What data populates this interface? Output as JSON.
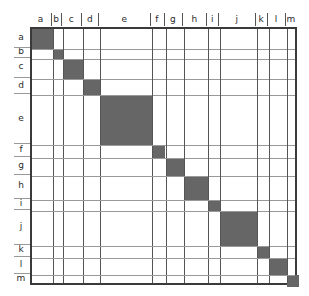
{
  "figure": {
    "title": ""
  },
  "axes": {
    "column_labels": [
      "a",
      "b",
      "c",
      "d",
      "e",
      "f",
      "g",
      "h",
      "i",
      "j",
      "k",
      "l",
      "m"
    ],
    "row_labels": [
      "a",
      "b",
      "c",
      "d",
      "e",
      "f",
      "g",
      "h",
      "i",
      "j",
      "k",
      "l",
      "m"
    ]
  },
  "colors": {
    "block_fill": "#666666",
    "frame": "#3a3a3a",
    "column_divider": "#555555",
    "row_divider": "#999999",
    "background": "#ffffff",
    "label": "#2b2b2b"
  },
  "chart_data": {
    "type": "heatmap",
    "title": "",
    "subtitle": "",
    "xlabel": "",
    "ylabel": "",
    "grid": true,
    "legend": "none",
    "symmetric": true,
    "note": "Block-diagonal adjacency matrix: each labelled group forms one filled square on the diagonal; all off-diagonal cells are empty.",
    "categories": [
      "a",
      "b",
      "c",
      "d",
      "e",
      "f",
      "g",
      "h",
      "i",
      "j",
      "k",
      "l",
      "m"
    ],
    "blocks": [
      {
        "label": "a",
        "start_frac": 0.0,
        "end_frac": 0.079,
        "size_frac": 0.079,
        "filled": true
      },
      {
        "label": "b",
        "start_frac": 0.079,
        "end_frac": 0.117,
        "size_frac": 0.038,
        "filled": true
      },
      {
        "label": "c",
        "start_frac": 0.117,
        "end_frac": 0.192,
        "size_frac": 0.075,
        "filled": true
      },
      {
        "label": "d",
        "start_frac": 0.192,
        "end_frac": 0.256,
        "size_frac": 0.064,
        "filled": true
      },
      {
        "label": "e",
        "start_frac": 0.256,
        "end_frac": 0.451,
        "size_frac": 0.195,
        "filled": true
      },
      {
        "label": "f",
        "start_frac": 0.451,
        "end_frac": 0.5,
        "size_frac": 0.049,
        "filled": true
      },
      {
        "label": "g",
        "start_frac": 0.5,
        "end_frac": 0.571,
        "size_frac": 0.071,
        "filled": true
      },
      {
        "label": "h",
        "start_frac": 0.571,
        "end_frac": 0.661,
        "size_frac": 0.09,
        "filled": true
      },
      {
        "label": "i",
        "start_frac": 0.661,
        "end_frac": 0.705,
        "size_frac": 0.044,
        "filled": true
      },
      {
        "label": "j",
        "start_frac": 0.705,
        "end_frac": 0.843,
        "size_frac": 0.138,
        "filled": true
      },
      {
        "label": "k",
        "start_frac": 0.843,
        "end_frac": 0.888,
        "size_frac": 0.045,
        "filled": true
      },
      {
        "label": "l",
        "start_frac": 0.888,
        "end_frac": 0.955,
        "size_frac": 0.067,
        "filled": true
      },
      {
        "label": "m",
        "start_frac": 0.955,
        "end_frac": 1.0,
        "size_frac": 0.045,
        "filled": true
      }
    ],
    "x": [
      "a",
      "b",
      "c",
      "d",
      "e",
      "f",
      "g",
      "h",
      "i",
      "j",
      "k",
      "l",
      "m"
    ],
    "y": [
      "a",
      "b",
      "c",
      "d",
      "e",
      "f",
      "g",
      "h",
      "i",
      "j",
      "k",
      "l",
      "m"
    ],
    "values": [
      [
        1,
        0,
        0,
        0,
        0,
        0,
        0,
        0,
        0,
        0,
        0,
        0,
        0
      ],
      [
        0,
        1,
        0,
        0,
        0,
        0,
        0,
        0,
        0,
        0,
        0,
        0,
        0
      ],
      [
        0,
        0,
        1,
        0,
        0,
        0,
        0,
        0,
        0,
        0,
        0,
        0,
        0
      ],
      [
        0,
        0,
        0,
        1,
        0,
        0,
        0,
        0,
        0,
        0,
        0,
        0,
        0
      ],
      [
        0,
        0,
        0,
        0,
        1,
        0,
        0,
        0,
        0,
        0,
        0,
        0,
        0
      ],
      [
        0,
        0,
        0,
        0,
        0,
        1,
        0,
        0,
        0,
        0,
        0,
        0,
        0
      ],
      [
        0,
        0,
        0,
        0,
        0,
        0,
        1,
        0,
        0,
        0,
        0,
        0,
        0
      ],
      [
        0,
        0,
        0,
        0,
        0,
        0,
        0,
        1,
        0,
        0,
        0,
        0,
        0
      ],
      [
        0,
        0,
        0,
        0,
        0,
        0,
        0,
        0,
        1,
        0,
        0,
        0,
        0
      ],
      [
        0,
        0,
        0,
        0,
        0,
        0,
        0,
        0,
        0,
        1,
        0,
        0,
        0
      ],
      [
        0,
        0,
        0,
        0,
        0,
        0,
        0,
        0,
        0,
        0,
        1,
        0,
        0
      ],
      [
        0,
        0,
        0,
        0,
        0,
        0,
        0,
        0,
        0,
        0,
        0,
        1,
        0
      ],
      [
        0,
        0,
        0,
        0,
        0,
        0,
        0,
        0,
        0,
        0,
        0,
        0,
        1
      ]
    ]
  }
}
